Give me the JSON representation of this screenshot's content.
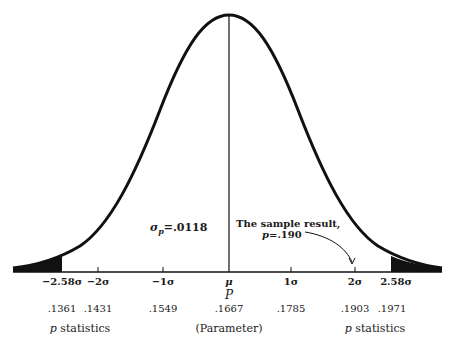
{
  "diagram": {
    "type": "normal-distribution-curve",
    "sigma_label": "σ",
    "sigma_sub": "p",
    "sigma_value": "=.0118",
    "annotation": {
      "line1": "The sample result,",
      "line2_var": "p",
      "line2_value": "=.190"
    },
    "ticks": [
      {
        "z": "−2.58σ",
        "value": ".1361"
      },
      {
        "z": "−2σ",
        "value": ".1431"
      },
      {
        "z": "−1σ",
        "value": ".1549"
      },
      {
        "z": "μ",
        "value": ".1667"
      },
      {
        "z": "1σ",
        "value": ".1785"
      },
      {
        "z": "2σ",
        "value": ".1903"
      },
      {
        "z": "2.58σ",
        "value": ".1971"
      }
    ],
    "mu_sub": "P",
    "left_caption_var": "p",
    "left_caption": " statistics",
    "center_caption": "(Parameter)",
    "right_caption_var": "p",
    "right_caption": " statistics"
  }
}
